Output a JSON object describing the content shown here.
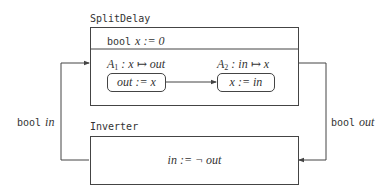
{
  "splitdelay": {
    "title": "SplitDelay",
    "state_decl": {
      "keyword": "bool",
      "expr": "x := 0"
    },
    "tasks": [
      {
        "name": "A",
        "index": "1",
        "signature": ": x ↦ out",
        "body": "out := x"
      },
      {
        "name": "A",
        "index": "2",
        "signature": ": in ↦ x",
        "body": "x := in"
      }
    ]
  },
  "inverter": {
    "title": "Inverter",
    "body": "in := ¬ out"
  },
  "connections": {
    "left": {
      "keyword": "bool",
      "var": "in"
    },
    "right": {
      "keyword": "bool",
      "var": "out"
    }
  },
  "colors": {
    "stroke": "#444444",
    "text": "#333333",
    "background": "#ffffff"
  }
}
